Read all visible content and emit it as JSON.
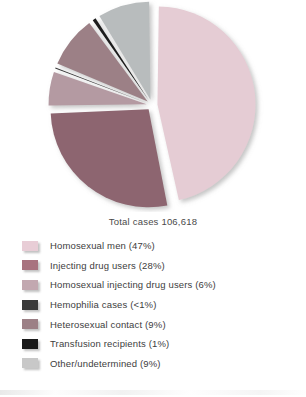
{
  "chart_data": {
    "type": "pie",
    "title": "",
    "caption": "Total cases 106,618",
    "total_cases": "106,618",
    "legend_position": "bottom",
    "exploded": true,
    "categories": [
      "Homosexual men",
      "Injecting drug users",
      "Homosexual injecting drug users",
      "Hemophilia cases",
      "Heterosexual contact",
      "Transfusion recipients",
      "Other/undetermined"
    ],
    "values": [
      47,
      28,
      6,
      0.6,
      9,
      1,
      9
    ],
    "value_labels": [
      "47%",
      "28%",
      "6%",
      "<1%",
      "9%",
      "1%",
      "9%"
    ],
    "colors": [
      "#e5ccd4",
      "#8d6570",
      "#b49aa2",
      "#3a3a3a",
      "#9c8086",
      "#1f1f1f",
      "#b8bcbd"
    ],
    "legend_colors": [
      "#e8cdd6",
      "#a8737f",
      "#c2a8b0",
      "#3a3a3a",
      "#9c8086",
      "#1a1a1a",
      "#c8c8c8"
    ],
    "legend": [
      {
        "label": "Homosexual men (47%)",
        "color": "#e8cdd6"
      },
      {
        "label": "Injecting drug users (28%)",
        "color": "#a8737f"
      },
      {
        "label": "Homosexual injecting drug users (6%)",
        "color": "#c2a8b0"
      },
      {
        "label": "Hemophilia cases (<1%)",
        "color": "#3a3a3a"
      },
      {
        "label": "Heterosexual contact (9%)",
        "color": "#9c8086"
      },
      {
        "label": "Transfusion recipients (1%)",
        "color": "#1a1a1a"
      },
      {
        "label": "Other/undetermined (9%)",
        "color": "#c8c8c8"
      }
    ]
  }
}
